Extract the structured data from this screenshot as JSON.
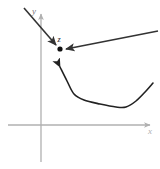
{
  "figure": {
    "background_color": "#ffffff",
    "axes": {
      "color": "#b0b0b0",
      "stroke_width": 1.3,
      "origin": {
        "x": 41,
        "y": 125
      },
      "x_axis": {
        "label": "x",
        "label_color": "#b0b0b0",
        "start": {
          "x": 8,
          "y": 125
        },
        "end": {
          "x": 150,
          "y": 125
        },
        "arrowhead": true,
        "label_pos": {
          "x": 150,
          "y": 134
        }
      },
      "y_axis": {
        "label": "y",
        "label_color": "#777777",
        "start": {
          "x": 41,
          "y": 162
        },
        "end": {
          "x": 41,
          "y": 14
        },
        "arrowhead": true,
        "label_pos": {
          "x": 34,
          "y": 14
        }
      }
    },
    "point": {
      "name": "z",
      "label": "z",
      "label_color": "#222222",
      "dot_color": "#111111",
      "dot_radius": 2.6,
      "position": {
        "x": 60,
        "y": 49
      },
      "label_pos": {
        "x": 59,
        "y": 42
      }
    },
    "arrows": [
      {
        "name": "upper-left-arrow",
        "color": "#333333",
        "stroke_width": 1.6,
        "from": {
          "x": 24,
          "y": 8
        },
        "to": {
          "x": 56,
          "y": 45
        },
        "arrowhead": "end"
      },
      {
        "name": "right-arrow",
        "color": "#333333",
        "stroke_width": 1.6,
        "from": {
          "x": 158,
          "y": 31
        },
        "to": {
          "x": 66,
          "y": 49
        },
        "arrowhead": "end"
      }
    ],
    "curve": {
      "name": "valley-curve",
      "color": "#222222",
      "stroke_width": 1.6,
      "arrowhead": "start",
      "arrow_tip": {
        "x": 60,
        "y": 67
      },
      "path_points": [
        {
          "x": 60,
          "y": 67
        },
        {
          "x": 67,
          "y": 81
        },
        {
          "x": 74,
          "y": 94
        },
        {
          "x": 84,
          "y": 100
        },
        {
          "x": 100,
          "y": 104
        },
        {
          "x": 116,
          "y": 107
        },
        {
          "x": 126,
          "y": 107
        },
        {
          "x": 136,
          "y": 101
        },
        {
          "x": 146,
          "y": 91
        },
        {
          "x": 153,
          "y": 83
        }
      ]
    }
  }
}
